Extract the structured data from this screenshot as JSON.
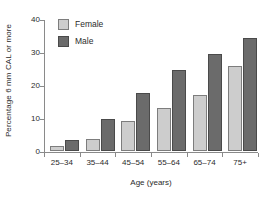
{
  "chart_data": {
    "type": "bar",
    "title": "",
    "subtitle": "",
    "xlabel": "Age (years)",
    "ylabel": "Percentage 6 mm CAL or more",
    "categories": [
      "25–34",
      "35–44",
      "45–54",
      "55–64",
      "65–74",
      "75+"
    ],
    "series": [
      {
        "name": "Female",
        "color": "#cdcdcd",
        "values": [
          1.5,
          3.7,
          9.2,
          13.1,
          17.1,
          25.7
        ]
      },
      {
        "name": "Male",
        "color": "#6b6b6b",
        "values": [
          3.4,
          9.6,
          17.6,
          24.4,
          29.4,
          34.3
        ]
      }
    ],
    "ylim": [
      0,
      40
    ],
    "yticks": [
      0,
      10,
      20,
      30,
      40
    ],
    "ytick_labels": [
      "0",
      "10",
      "20",
      "30",
      "40"
    ],
    "grid": false,
    "legend_position": "top-left"
  },
  "legend": {
    "entries": [
      {
        "label": "Female"
      },
      {
        "label": "Male"
      }
    ]
  },
  "axes": {
    "x_title": "Age (years)",
    "y_title": "Percentage 6 mm CAL or more"
  }
}
